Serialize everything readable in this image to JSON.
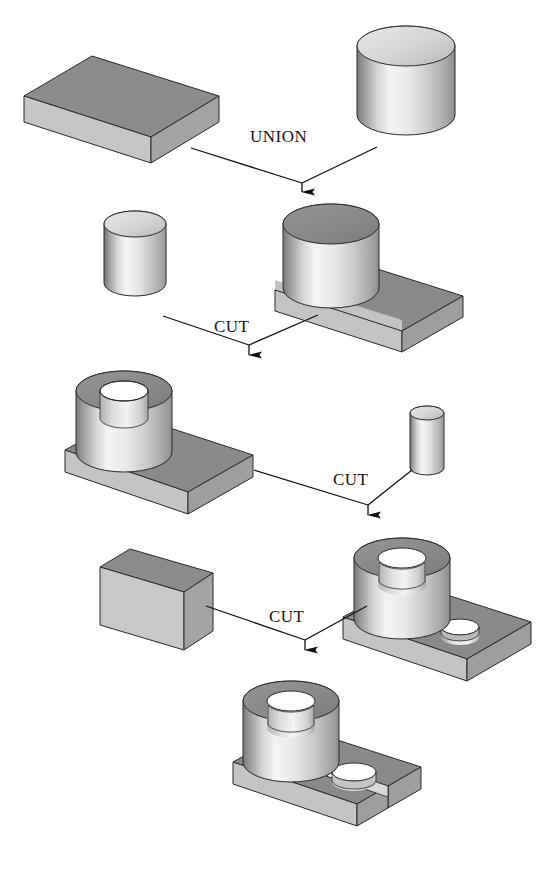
{
  "figure": {
    "title_fragment": "",
    "type": "csg-construction-tree",
    "background": "#ffffff",
    "width": 557,
    "height": 881
  },
  "palette": {
    "outline": "#1a1a1a",
    "box_top": "#8c8c8c",
    "box_front": "#c9c9c9",
    "box_side": "#a6a6a6",
    "plate_top": "#8a8a8a",
    "plate_front": "#c4c4c4",
    "plate_side": "#9e9e9e",
    "cyl_light": "#f2f2f2",
    "cyl_mid": "#bdbdbd",
    "cyl_dark": "#6f6f6f",
    "cyl_top_dark": "#8a8a8a",
    "cyl_top_light": "#d8d8d8",
    "hole_dark": "#7d7d7d",
    "arrow": "#111111"
  },
  "operations": [
    {
      "id": "op-union",
      "label": "UNION",
      "x": 250,
      "y": 130
    },
    {
      "id": "op-cut-1",
      "label": "CUT",
      "x": 214,
      "y": 320
    },
    {
      "id": "op-cut-2",
      "label": "CUT",
      "x": 333,
      "y": 473
    },
    {
      "id": "op-cut-3",
      "label": "CUT",
      "x": 269,
      "y": 610
    }
  ],
  "shapes": [
    {
      "id": "shape-block-plate",
      "name": "rectangular block",
      "row": 1,
      "side": "left"
    },
    {
      "id": "shape-cylinder-large",
      "name": "large cylinder",
      "row": 1,
      "side": "right"
    },
    {
      "id": "shape-cylinder-medium",
      "name": "medium cylinder",
      "row": 2,
      "side": "left"
    },
    {
      "id": "shape-union-result",
      "name": "block union cylinder",
      "row": 2,
      "side": "right"
    },
    {
      "id": "shape-tube-on-plate",
      "name": "bored boss on plate",
      "row": 3,
      "side": "left"
    },
    {
      "id": "shape-cylinder-small",
      "name": "small cylinder",
      "row": 3,
      "side": "right"
    },
    {
      "id": "shape-block-slot-tool",
      "name": "slotting block",
      "row": 4,
      "side": "left"
    },
    {
      "id": "shape-boss-plus-hole",
      "name": "boss plate with hole",
      "row": 4,
      "side": "right"
    },
    {
      "id": "shape-final-part",
      "name": "final machined part",
      "row": 5,
      "side": "center"
    }
  ],
  "arrows": [
    {
      "id": "arrow-union",
      "from": [
        "block-plate",
        "cylinder-large"
      ],
      "to": "union-result"
    },
    {
      "id": "arrow-cut-1",
      "from": [
        "cylinder-medium",
        "union-result"
      ],
      "to": "tube-on-plate"
    },
    {
      "id": "arrow-cut-2",
      "from": [
        "tube-on-plate",
        "cylinder-small"
      ],
      "to": "boss-plus-hole"
    },
    {
      "id": "arrow-cut-3",
      "from": [
        "block-slot-tool",
        "boss-plus-hole"
      ],
      "to": "final-part"
    }
  ]
}
